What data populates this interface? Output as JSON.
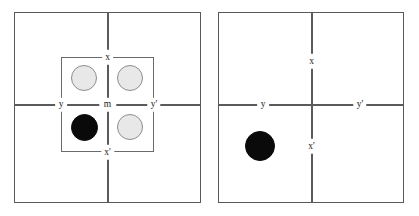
{
  "figure": {
    "kind": "two-panel-schematic",
    "background_color": "#ffffff",
    "frame_color": "#59595b",
    "axis_color": "#5b5b5d",
    "label_color": "#1a1a1a",
    "disc_light_fill": "#e8e8e8",
    "disc_light_stroke": "#8d8d8f",
    "disc_dark_fill": "#0a0a0a"
  },
  "panels": [
    {
      "id": "left",
      "name": "left-panel",
      "axis_labels": {
        "top": "x",
        "bottom": "x'",
        "left": "y",
        "right": "y'",
        "center": "m"
      },
      "inner_square": {
        "present": true,
        "name": "inner-square"
      },
      "discs": [
        {
          "name": "disc-top-left",
          "state": "light"
        },
        {
          "name": "disc-top-right",
          "state": "light"
        },
        {
          "name": "disc-bottom-left",
          "state": "dark"
        },
        {
          "name": "disc-bottom-right",
          "state": "light"
        }
      ]
    },
    {
      "id": "right",
      "name": "right-panel",
      "axis_labels": {
        "top": "x",
        "bottom": "x'",
        "left": "y",
        "right": "y'",
        "center": ""
      },
      "inner_square": {
        "present": false,
        "name": "inner-square"
      },
      "discs": [
        {
          "name": "disc-bottom-left",
          "state": "dark"
        }
      ]
    }
  ]
}
